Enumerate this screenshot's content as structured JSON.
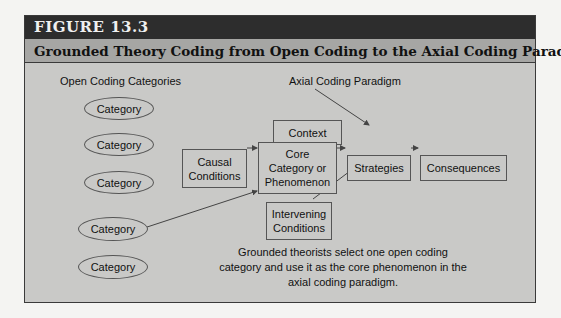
{
  "figure": {
    "number": "FIGURE 13.3",
    "title": "Grounded Theory Coding from Open Coding to the Axial Coding Paradigm"
  },
  "left_section": {
    "heading": "Open Coding Categories",
    "categories": [
      "Category",
      "Category",
      "Category",
      "Category",
      "Category"
    ]
  },
  "right_section": {
    "heading": "Axial Coding Paradigm",
    "nodes": {
      "context": "Context",
      "causal": "Causal Conditions",
      "core": "Core Category or Phenomenon",
      "strategies": "Strategies",
      "consequences": "Consequences",
      "intervening": "Intervening Conditions"
    }
  },
  "note": "Grounded theorists select one open coding category and use it as the core phenomenon in the axial coding paradigm.",
  "colors": {
    "header_bg": "#2d2d2d",
    "subtitle_bg": "#a6a6a4",
    "body_bg": "#c9c9c7",
    "line": "#444444"
  }
}
